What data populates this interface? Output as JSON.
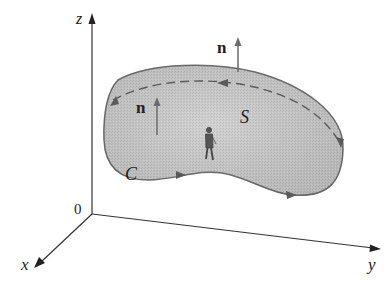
{
  "figure": {
    "axes": {
      "z_label": "z",
      "x_label": "x",
      "y_label": "y",
      "origin_label": "0"
    },
    "labels": {
      "normal_top": "n",
      "normal_left": "n",
      "surface": "S",
      "curve": "C"
    },
    "colors": {
      "surface_fill": "#c8c8c8",
      "surface_edge": "#6a6a6a",
      "axis": "#333333",
      "arrow": "#6a6a6a"
    }
  }
}
